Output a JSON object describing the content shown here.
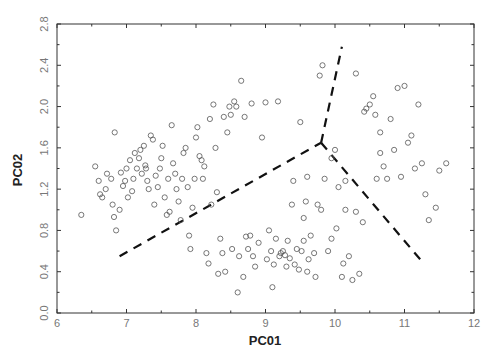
{
  "chart_data": {
    "type": "scatter",
    "title": "",
    "xlabel": "PC01",
    "ylabel": "PC02",
    "xlim": [
      6,
      12
    ],
    "ylim": [
      0.0,
      2.8
    ],
    "x_ticks": [
      "6",
      "7",
      "8",
      "9",
      "10",
      "11",
      "12"
    ],
    "y_ticks": [
      "0.0",
      "0.4",
      "0.8",
      "1.2",
      "1.6",
      "2.0",
      "2.4",
      "2.8"
    ],
    "grid": false,
    "legend": null,
    "marker": "open-circle",
    "series": [
      {
        "name": "samples",
        "points": [
          [
            6.35,
            0.95
          ],
          [
            6.55,
            1.42
          ],
          [
            6.6,
            1.28
          ],
          [
            6.62,
            1.15
          ],
          [
            6.65,
            1.12
          ],
          [
            6.7,
            1.2
          ],
          [
            6.72,
            1.35
          ],
          [
            6.78,
            1.3
          ],
          [
            6.8,
            1.05
          ],
          [
            6.82,
            0.93
          ],
          [
            6.83,
            1.75
          ],
          [
            6.85,
            0.8
          ],
          [
            6.9,
            1.0
          ],
          [
            6.92,
            1.36
          ],
          [
            6.95,
            1.23
          ],
          [
            6.98,
            1.28
          ],
          [
            7.0,
            1.4
          ],
          [
            7.02,
            1.12
          ],
          [
            7.05,
            1.48
          ],
          [
            7.08,
            1.18
          ],
          [
            7.1,
            1.3
          ],
          [
            7.12,
            1.55
          ],
          [
            7.15,
            1.4
          ],
          [
            7.18,
            1.5
          ],
          [
            7.2,
            1.58
          ],
          [
            7.22,
            1.35
          ],
          [
            7.25,
            1.62
          ],
          [
            7.27,
            1.43
          ],
          [
            7.28,
            1.4
          ],
          [
            7.3,
            1.28
          ],
          [
            7.32,
            1.2
          ],
          [
            7.35,
            1.72
          ],
          [
            7.38,
            1.68
          ],
          [
            7.4,
            1.05
          ],
          [
            7.42,
            1.33
          ],
          [
            7.45,
            1.22
          ],
          [
            7.48,
            1.4
          ],
          [
            7.5,
            1.5
          ],
          [
            7.52,
            1.62
          ],
          [
            7.55,
            1.12
          ],
          [
            7.58,
            0.95
          ],
          [
            7.6,
            1.3
          ],
          [
            7.62,
            0.98
          ],
          [
            7.65,
            1.82
          ],
          [
            7.67,
            1.45
          ],
          [
            7.7,
            1.35
          ],
          [
            7.72,
            1.2
          ],
          [
            7.75,
            1.08
          ],
          [
            7.78,
            0.9
          ],
          [
            7.8,
            1.3
          ],
          [
            7.82,
            1.55
          ],
          [
            7.85,
            1.6
          ],
          [
            7.88,
            1.22
          ],
          [
            7.9,
            0.75
          ],
          [
            7.92,
            0.62
          ],
          [
            7.95,
            1.02
          ],
          [
            7.98,
            1.3
          ],
          [
            8.0,
            1.7
          ],
          [
            8.02,
            1.8
          ],
          [
            8.05,
            1.52
          ],
          [
            8.08,
            1.48
          ],
          [
            8.1,
            1.3
          ],
          [
            8.12,
            1.42
          ],
          [
            8.15,
            0.58
          ],
          [
            8.18,
            0.48
          ],
          [
            8.2,
            1.88
          ],
          [
            8.22,
            1.05
          ],
          [
            8.25,
            2.02
          ],
          [
            8.28,
            1.6
          ],
          [
            8.3,
            1.17
          ],
          [
            8.32,
            0.38
          ],
          [
            8.35,
            0.72
          ],
          [
            8.38,
            0.58
          ],
          [
            8.4,
            1.9
          ],
          [
            8.42,
            0.4
          ],
          [
            8.45,
            1.75
          ],
          [
            8.48,
            2.0
          ],
          [
            8.5,
            1.92
          ],
          [
            8.52,
            0.62
          ],
          [
            8.55,
            2.05
          ],
          [
            8.58,
            2.0
          ],
          [
            8.6,
            0.2
          ],
          [
            8.62,
            0.55
          ],
          [
            8.65,
            2.25
          ],
          [
            8.68,
            0.35
          ],
          [
            8.7,
            1.9
          ],
          [
            8.72,
            0.74
          ],
          [
            8.75,
            0.62
          ],
          [
            8.78,
            0.75
          ],
          [
            8.8,
            2.03
          ],
          [
            8.82,
            0.55
          ],
          [
            8.85,
            0.45
          ],
          [
            8.9,
            0.68
          ],
          [
            8.95,
            1.7
          ],
          [
            9.0,
            2.04
          ],
          [
            9.02,
            0.52
          ],
          [
            9.05,
            0.8
          ],
          [
            9.08,
            0.6
          ],
          [
            9.1,
            0.25
          ],
          [
            9.12,
            0.47
          ],
          [
            9.15,
            0.72
          ],
          [
            9.18,
            2.05
          ],
          [
            9.2,
            0.55
          ],
          [
            9.22,
            0.58
          ],
          [
            9.25,
            0.6
          ],
          [
            9.28,
            0.56
          ],
          [
            9.3,
            0.45
          ],
          [
            9.32,
            0.7
          ],
          [
            9.35,
            0.53
          ],
          [
            9.38,
            1.05
          ],
          [
            9.4,
            1.28
          ],
          [
            9.42,
            0.47
          ],
          [
            9.45,
            0.62
          ],
          [
            9.48,
            0.42
          ],
          [
            9.5,
            1.85
          ],
          [
            9.52,
            0.6
          ],
          [
            9.55,
            0.7
          ],
          [
            9.58,
            1.08
          ],
          [
            9.6,
            0.4
          ],
          [
            9.62,
            0.52
          ],
          [
            9.65,
            0.75
          ],
          [
            9.7,
            0.58
          ],
          [
            9.72,
            0.35
          ],
          [
            9.75,
            1.05
          ],
          [
            9.78,
            2.3
          ],
          [
            9.8,
            1.0
          ],
          [
            9.82,
            2.4
          ],
          [
            9.85,
            1.3
          ],
          [
            9.9,
            0.6
          ],
          [
            9.95,
            0.72
          ],
          [
            10.0,
            1.58
          ],
          [
            10.02,
            0.82
          ],
          [
            10.05,
            1.22
          ],
          [
            10.1,
            0.35
          ],
          [
            10.12,
            0.48
          ],
          [
            10.15,
            1.0
          ],
          [
            10.2,
            0.55
          ],
          [
            10.25,
            0.32
          ],
          [
            10.3,
            2.32
          ],
          [
            10.35,
            0.38
          ],
          [
            10.42,
            1.95
          ],
          [
            10.45,
            1.98
          ],
          [
            10.5,
            2.02
          ],
          [
            10.55,
            2.1
          ],
          [
            10.6,
            1.3
          ],
          [
            10.65,
            1.55
          ],
          [
            10.7,
            1.42
          ],
          [
            10.75,
            1.3
          ],
          [
            10.8,
            1.88
          ],
          [
            10.85,
            1.58
          ],
          [
            10.9,
            2.18
          ],
          [
            10.95,
            1.32
          ],
          [
            11.0,
            2.2
          ],
          [
            11.05,
            1.65
          ],
          [
            11.1,
            1.72
          ],
          [
            11.15,
            1.4
          ],
          [
            11.2,
            2.02
          ],
          [
            11.25,
            1.45
          ],
          [
            11.3,
            1.15
          ],
          [
            11.35,
            0.9
          ],
          [
            11.45,
            1.02
          ],
          [
            11.5,
            1.38
          ],
          [
            11.6,
            1.45
          ],
          [
            10.65,
            1.75
          ],
          [
            10.58,
            1.92
          ],
          [
            10.4,
            0.88
          ],
          [
            10.3,
            0.98
          ],
          [
            10.15,
            1.28
          ],
          [
            9.95,
            1.5
          ],
          [
            9.6,
            1.32
          ],
          [
            9.55,
            0.92
          ]
        ]
      }
    ],
    "annotations": [
      {
        "type": "dashed-line",
        "points": [
          [
            6.9,
            0.55
          ],
          [
            9.8,
            1.65
          ]
        ]
      },
      {
        "type": "dashed-line",
        "points": [
          [
            9.8,
            1.65
          ],
          [
            10.1,
            2.58
          ]
        ]
      },
      {
        "type": "dashed-line",
        "points": [
          [
            9.8,
            1.65
          ],
          [
            11.25,
            0.5
          ]
        ]
      }
    ]
  }
}
